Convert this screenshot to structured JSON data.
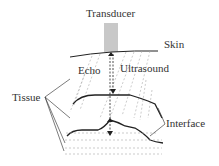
{
  "labels": {
    "transducer": "Transducer",
    "skin": "Skin",
    "echo": "Echo",
    "ultrasound": "Ultrasound",
    "tissue": "Tissue",
    "interface": "Interface"
  },
  "colors": {
    "transducer_fill": "#c8c8c8",
    "line": "#222222",
    "dashed": "#999999"
  }
}
